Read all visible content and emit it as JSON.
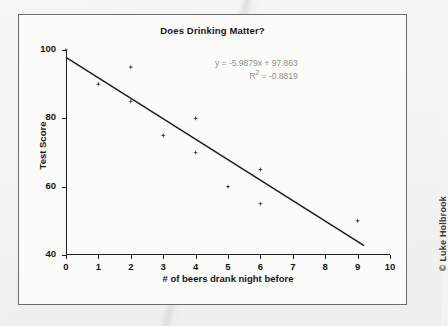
{
  "chart_data": {
    "type": "scatter",
    "title": "Does Drinking Matter?",
    "xlabel": "# of beers drank night before",
    "ylabel": "Test Score",
    "xlim": [
      0,
      10
    ],
    "ylim": [
      40,
      100
    ],
    "x_ticks": [
      "0",
      "1",
      "2",
      "3",
      "4",
      "5",
      "6",
      "7",
      "8",
      "9",
      "10"
    ],
    "y_ticks": [
      "40",
      "60",
      "80",
      "100"
    ],
    "grid": false,
    "legend": "none",
    "series": [
      {
        "name": "Test scores",
        "marker": "diamond",
        "color": "#3a3a3a",
        "points": [
          {
            "x": 0,
            "y": 100
          },
          {
            "x": 1,
            "y": 90
          },
          {
            "x": 2,
            "y": 95
          },
          {
            "x": 2,
            "y": 85
          },
          {
            "x": 3,
            "y": 75
          },
          {
            "x": 4,
            "y": 80
          },
          {
            "x": 4,
            "y": 70
          },
          {
            "x": 5,
            "y": 60
          },
          {
            "x": 6,
            "y": 65
          },
          {
            "x": 6,
            "y": 55
          },
          {
            "x": 9,
            "y": 50
          }
        ]
      }
    ],
    "trendline": {
      "type": "linear",
      "slope": -5.9879,
      "intercept": 97.863,
      "x_start": 0,
      "x_end": 9.2,
      "color": "#1d1d1d"
    },
    "annotations": {
      "equation": "y = -5.9879x + 97.863",
      "r_squared_prefix": "R",
      "r_squared_exponent": "2",
      "r_squared_value": " = -0.8819",
      "color": "#909090"
    }
  },
  "page": {
    "copyright": "© Luke Holbrook"
  }
}
